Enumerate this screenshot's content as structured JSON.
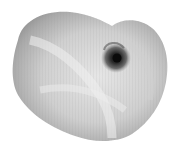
{
  "image": {
    "subject": "nautilus shell",
    "background": "#ffffff",
    "colors": {
      "shell_light": "#e4e4e4",
      "shell_mid": "#b8b8b8",
      "shell_dark": "#8a8a8a",
      "spiral_dark": "#202020"
    }
  }
}
